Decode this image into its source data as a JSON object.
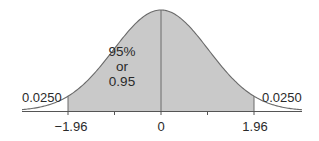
{
  "chart_data": {
    "type": "area",
    "title": "",
    "xlabel": "",
    "ylabel": "",
    "x_ticks": [
      -1.96,
      0,
      1.96
    ],
    "x_tick_labels": [
      "−1.96",
      "0",
      "1.96"
    ],
    "xlim": [
      -3.0,
      3.0
    ],
    "grid": false,
    "shaded_region": {
      "from": -1.96,
      "to": 1.96,
      "area": 0.95
    },
    "tails": [
      {
        "side": "left",
        "from": "-inf",
        "to": -1.96,
        "area": 0.025
      },
      {
        "side": "right",
        "from": 1.96,
        "to": "inf",
        "area": 0.025
      }
    ],
    "annotations": {
      "center": [
        "95%",
        "or",
        "0.95"
      ],
      "left_tail": "0.0250",
      "right_tail": "0.0250"
    },
    "colors": {
      "shade": "#c8c8c8",
      "curve": "#6a6a6a",
      "axis": "#555555"
    }
  }
}
